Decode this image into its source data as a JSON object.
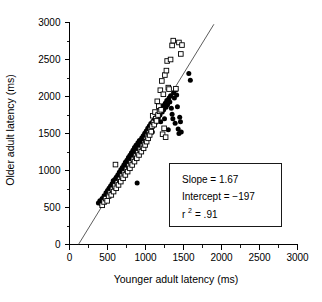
{
  "chart_data": {
    "type": "scatter",
    "title": "",
    "xlabel": "Younger adult latency (ms)",
    "ylabel": "Older adult latency (ms)",
    "xlim": [
      0,
      3000
    ],
    "ylim": [
      0,
      3000
    ],
    "xticks": [
      0,
      500,
      1000,
      1500,
      2000,
      2500,
      3000
    ],
    "yticks": [
      0,
      500,
      1000,
      1500,
      2000,
      2500,
      3000
    ],
    "xtick_labels": [
      "0",
      "500",
      "1000",
      "1500",
      "2000",
      "2500",
      "3000"
    ],
    "ytick_labels": [
      "0",
      "500",
      "1000",
      "1500",
      "2000",
      "2500",
      "3000"
    ],
    "minor_tick_step": 250,
    "grid": false,
    "legend": null,
    "regression": {
      "slope": 1.67,
      "intercept": -197,
      "r_squared": 0.91,
      "x_start": 120,
      "x_end": 1900
    },
    "annotations": {
      "slope_label": "Slope = 1.67",
      "intercept_label": "Intercept = −197",
      "r2_base": "r",
      "r2_exponent": "2",
      "r2_value": "= .91"
    },
    "series": [
      {
        "name": "filled-circles",
        "marker": "circle",
        "fill": "#000000",
        "points": [
          [
            380,
            560
          ],
          [
            400,
            590
          ],
          [
            420,
            545
          ],
          [
            430,
            620
          ],
          [
            450,
            600
          ],
          [
            455,
            660
          ],
          [
            470,
            640
          ],
          [
            480,
            700
          ],
          [
            495,
            675
          ],
          [
            500,
            730
          ],
          [
            510,
            690
          ],
          [
            520,
            760
          ],
          [
            530,
            720
          ],
          [
            540,
            790
          ],
          [
            550,
            745
          ],
          [
            560,
            820
          ],
          [
            570,
            780
          ],
          [
            575,
            860
          ],
          [
            585,
            800
          ],
          [
            595,
            880
          ],
          [
            605,
            840
          ],
          [
            615,
            910
          ],
          [
            625,
            865
          ],
          [
            635,
            940
          ],
          [
            645,
            900
          ],
          [
            655,
            975
          ],
          [
            665,
            930
          ],
          [
            675,
            1010
          ],
          [
            685,
            960
          ],
          [
            695,
            1040
          ],
          [
            705,
            1000
          ],
          [
            715,
            1075
          ],
          [
            725,
            1030
          ],
          [
            735,
            1110
          ],
          [
            745,
            1060
          ],
          [
            755,
            1140
          ],
          [
            765,
            1095
          ],
          [
            775,
            1175
          ],
          [
            785,
            1120
          ],
          [
            795,
            1205
          ],
          [
            805,
            1160
          ],
          [
            815,
            1240
          ],
          [
            825,
            1190
          ],
          [
            835,
            1275
          ],
          [
            845,
            1225
          ],
          [
            855,
            1310
          ],
          [
            865,
            1255
          ],
          [
            875,
            1340
          ],
          [
            885,
            1290
          ],
          [
            890,
            830
          ],
          [
            900,
            1375
          ],
          [
            910,
            1320
          ],
          [
            920,
            1405
          ],
          [
            930,
            1355
          ],
          [
            940,
            1300
          ],
          [
            950,
            1440
          ],
          [
            960,
            1390
          ],
          [
            970,
            1470
          ],
          [
            980,
            1420
          ],
          [
            990,
            1505
          ],
          [
            1000,
            1455
          ],
          [
            1010,
            1535
          ],
          [
            1020,
            1480
          ],
          [
            1030,
            1570
          ],
          [
            1040,
            1515
          ],
          [
            1050,
            1600
          ],
          [
            1060,
            1545
          ],
          [
            1070,
            1635
          ],
          [
            1080,
            1580
          ],
          [
            1090,
            1520
          ],
          [
            1100,
            1665
          ],
          [
            1110,
            1610
          ],
          [
            1120,
            1700
          ],
          [
            1130,
            1645
          ],
          [
            1140,
            1735
          ],
          [
            1150,
            1680
          ],
          [
            1160,
            1770
          ],
          [
            1170,
            1715
          ],
          [
            1180,
            1805
          ],
          [
            1190,
            1750
          ],
          [
            1200,
            1660
          ],
          [
            1210,
            1840
          ],
          [
            1220,
            1790
          ],
          [
            1230,
            1875
          ],
          [
            1240,
            1820
          ],
          [
            1250,
            1700
          ],
          [
            1260,
            1910
          ],
          [
            1270,
            1855
          ],
          [
            1280,
            1945
          ],
          [
            1290,
            1890
          ],
          [
            1300,
            1550
          ],
          [
            1310,
            1980
          ],
          [
            1320,
            1925
          ],
          [
            1330,
            2010
          ],
          [
            1340,
            1840
          ],
          [
            1350,
            1760
          ],
          [
            1360,
            1700
          ],
          [
            1370,
            2050
          ],
          [
            1380,
            1980
          ],
          [
            1390,
            1640
          ],
          [
            1400,
            2090
          ],
          [
            1410,
            2020
          ],
          [
            1420,
            1860
          ],
          [
            1430,
            1560
          ],
          [
            1440,
            1500
          ],
          [
            1450,
            1720
          ],
          [
            1460,
            1660
          ],
          [
            1470,
            1520
          ],
          [
            1570,
            2310
          ],
          [
            1590,
            2220
          ]
        ]
      },
      {
        "name": "open-squares",
        "marker": "square",
        "fill": "#ffffff",
        "points": [
          [
            430,
            530
          ],
          [
            455,
            575
          ],
          [
            475,
            620
          ],
          [
            495,
            590
          ],
          [
            515,
            655
          ],
          [
            535,
            700
          ],
          [
            550,
            670
          ],
          [
            565,
            745
          ],
          [
            580,
            715
          ],
          [
            595,
            790
          ],
          [
            605,
            1080
          ],
          [
            615,
            760
          ],
          [
            630,
            835
          ],
          [
            645,
            805
          ],
          [
            660,
            880
          ],
          [
            675,
            850
          ],
          [
            690,
            925
          ],
          [
            705,
            895
          ],
          [
            720,
            970
          ],
          [
            735,
            940
          ],
          [
            750,
            1015
          ],
          [
            765,
            985
          ],
          [
            780,
            1060
          ],
          [
            795,
            1030
          ],
          [
            810,
            1105
          ],
          [
            825,
            1075
          ],
          [
            840,
            1150
          ],
          [
            855,
            1120
          ],
          [
            870,
            1195
          ],
          [
            885,
            1165
          ],
          [
            900,
            1240
          ],
          [
            915,
            1210
          ],
          [
            930,
            1285
          ],
          [
            945,
            1255
          ],
          [
            960,
            1330
          ],
          [
            975,
            1300
          ],
          [
            985,
            1375
          ],
          [
            995,
            1345
          ],
          [
            1005,
            1420
          ],
          [
            1015,
            1390
          ],
          [
            1025,
            1465
          ],
          [
            1035,
            1435
          ],
          [
            1045,
            1510
          ],
          [
            1055,
            1480
          ],
          [
            1065,
            1555
          ],
          [
            1075,
            1525
          ],
          [
            1085,
            1600
          ],
          [
            1095,
            1740
          ],
          [
            1105,
            1650
          ],
          [
            1115,
            1620
          ],
          [
            1125,
            1790
          ],
          [
            1135,
            1700
          ],
          [
            1145,
            1670
          ],
          [
            1155,
            1935
          ],
          [
            1165,
            1750
          ],
          [
            1175,
            1870
          ],
          [
            1185,
            1800
          ],
          [
            1195,
            2085
          ],
          [
            1205,
            1820
          ],
          [
            1215,
            2210
          ],
          [
            1225,
            1490
          ],
          [
            1235,
            2030
          ],
          [
            1245,
            1570
          ],
          [
            1255,
            2290
          ],
          [
            1265,
            1450
          ],
          [
            1275,
            2350
          ],
          [
            1285,
            2480
          ],
          [
            1300,
            2120
          ],
          [
            1310,
            2100
          ],
          [
            1330,
            2500
          ],
          [
            1350,
            2690
          ],
          [
            1365,
            2755
          ],
          [
            1400,
            2105
          ],
          [
            1440,
            2730
          ],
          [
            1465,
            2575
          ],
          [
            1480,
            2695
          ]
        ]
      }
    ]
  }
}
